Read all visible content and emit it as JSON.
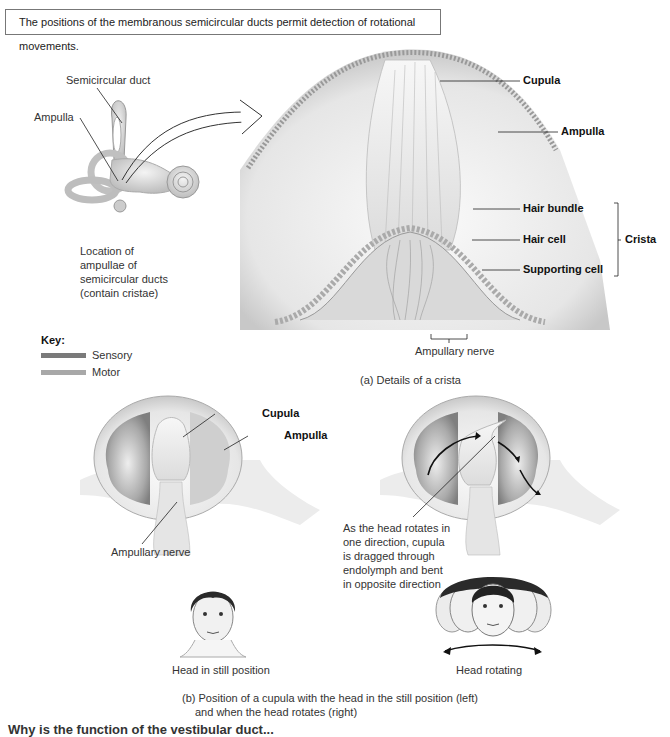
{
  "title": "The positions of the membranous semicircular ducts permit detection of rotational movements.",
  "inner_ear": {
    "labels": {
      "semicircular_duct": "Semicircular duct",
      "ampulla": "Ampulla"
    },
    "caption": "Location of ampullae of semicircular ducts (contain cristae)"
  },
  "key": {
    "heading": "Key:",
    "items": [
      {
        "label": "Sensory",
        "color": "#7a7a7a"
      },
      {
        "label": "Motor",
        "color": "#a8a8a8"
      }
    ]
  },
  "panel_a": {
    "labels": {
      "cupula": "Cupula",
      "ampulla": "Ampulla",
      "hair_bundle": "Hair bundle",
      "hair_cell": "Hair cell",
      "supporting_cell": "Supporting cell",
      "crista": "Crista",
      "ampullary_nerve": "Ampullary nerve"
    },
    "caption": "(a) Details of a crista"
  },
  "panel_b": {
    "left": {
      "labels": {
        "cupula": "Cupula",
        "ampulla": "Ampulla",
        "ampullary_nerve": "Ampullary nerve"
      },
      "head_caption": "Head in still position"
    },
    "right": {
      "annotation": "As the head rotates in one direction, cupula is dragged through endolymph and bent in opposite direction",
      "head_caption": "Head rotating"
    },
    "caption_line1": "(b) Position of a cupula with the head in the still position (left)",
    "caption_line2": "and when the head rotates (right)"
  },
  "footer_cut": "Why is the function of the vestibular duct..."
}
